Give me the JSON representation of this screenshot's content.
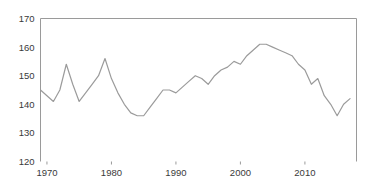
{
  "chart_data": {
    "type": "line",
    "title": "",
    "subtitle": "",
    "xlabel": "",
    "ylabel": "",
    "xlim": [
      1969,
      2018
    ],
    "ylim": [
      120,
      170
    ],
    "grid": false,
    "legend": null,
    "legend_position": "none",
    "line_color": "#9b9b9b",
    "frame_color": "#9a9a9a",
    "text_color": "#3a3a3a",
    "y_ticks": [
      120,
      130,
      140,
      150,
      160,
      170
    ],
    "y_tick_labels": [
      "120",
      "130",
      "140",
      "150",
      "160",
      "170"
    ],
    "x_ticks": [
      1970,
      1980,
      1990,
      2000,
      2010
    ],
    "x_tick_labels": [
      "1970",
      "1980",
      "1990",
      "2000",
      "2010"
    ],
    "x": [
      1969,
      1970,
      1971,
      1972,
      1973,
      1974,
      1975,
      1976,
      1977,
      1978,
      1979,
      1980,
      1981,
      1982,
      1983,
      1984,
      1985,
      1986,
      1987,
      1988,
      1989,
      1990,
      1991,
      1992,
      1993,
      1994,
      1995,
      1996,
      1997,
      1998,
      1999,
      2000,
      2001,
      2002,
      2003,
      2004,
      2005,
      2006,
      2007,
      2008,
      2009,
      2010,
      2011,
      2012,
      2013,
      2014,
      2015,
      2016,
      2017
    ],
    "values": [
      145,
      143,
      141,
      145,
      154,
      147,
      141,
      144,
      147,
      150,
      156,
      149,
      144,
      140,
      137,
      136,
      136,
      139,
      142,
      145,
      145,
      144,
      146,
      148,
      150,
      149,
      147,
      150,
      152,
      153,
      155,
      154,
      157,
      159,
      161,
      161,
      160,
      159,
      158,
      157,
      154,
      152,
      147,
      149,
      143,
      140,
      136,
      140,
      142
    ],
    "series": [
      {
        "name": "series-1",
        "values": [
          145,
          143,
          141,
          145,
          154,
          147,
          141,
          144,
          147,
          150,
          156,
          149,
          144,
          140,
          137,
          136,
          136,
          139,
          142,
          145,
          145,
          144,
          146,
          148,
          150,
          149,
          147,
          150,
          152,
          153,
          155,
          154,
          157,
          159,
          161,
          161,
          160,
          159,
          158,
          157,
          154,
          152,
          147,
          149,
          143,
          140,
          136,
          140,
          142
        ]
      }
    ]
  }
}
